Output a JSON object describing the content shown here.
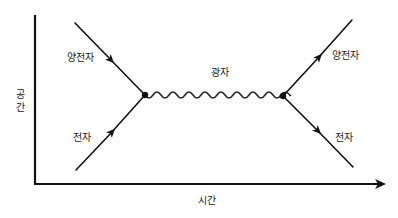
{
  "diagram": {
    "type": "feynman-diagram",
    "axes": {
      "x_label": "시간",
      "y_label_chars": [
        "공",
        "간"
      ],
      "y_label": "공간"
    },
    "particles": {
      "incoming_positron": "양전자",
      "incoming_electron": "전자",
      "photon": "광자",
      "outgoing_positron": "양전자",
      "outgoing_electron": "전자"
    },
    "colors": {
      "line": "#111111",
      "text": "#222222",
      "background": "#ffffff"
    }
  }
}
